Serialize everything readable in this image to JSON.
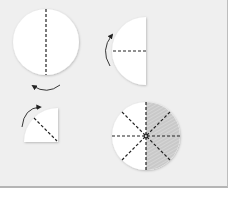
{
  "diagram": {
    "colors": {
      "background": "#efefef",
      "paper": "#ffffff",
      "fold_line": "#222222",
      "arrow": "#222222",
      "shade": "#c4c4c4",
      "border": "#b5b5b5"
    },
    "steps": [
      {
        "id": "step-1",
        "shape": "full-circle",
        "fold": "vertical dashed line"
      },
      {
        "id": "step-2",
        "shape": "half-circle",
        "fold": "horizontal dashed line"
      },
      {
        "id": "step-3",
        "shape": "quarter-circle",
        "fold": "diagonal dashed line"
      },
      {
        "id": "step-4",
        "shape": "unfolded circle",
        "fold": "eight radial dashed lines",
        "shaded_half": "right"
      }
    ],
    "arrows": [
      {
        "id": "arrow-1",
        "direction": "fold left half over (curved)"
      },
      {
        "id": "arrow-2",
        "direction": "fold up (curved)"
      },
      {
        "id": "arrow-3",
        "direction": "fold over (curved)"
      }
    ]
  }
}
